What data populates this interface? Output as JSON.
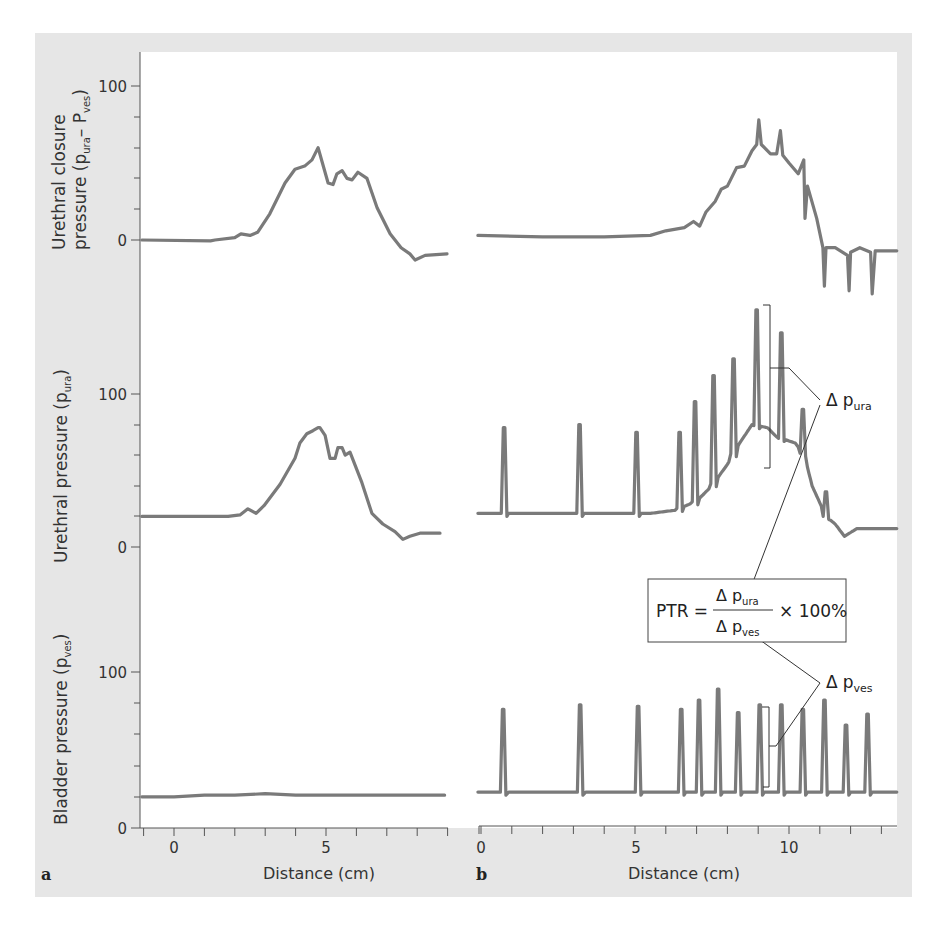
{
  "figure": {
    "background_color": "#e6e6e6",
    "plot_area_color": "#ffffff",
    "trace_color": "#7a7a7a",
    "panel_labels": [
      "a",
      "b"
    ]
  },
  "axes": {
    "x_label": "Distance (cm)",
    "panel_a_x_ticks": [
      "0",
      "5"
    ],
    "panel_b_x_ticks": [
      "0",
      "5",
      "10"
    ],
    "rows": [
      {
        "id": "closure",
        "y_label_line1": "Urethral closure",
        "y_label_line2": "pressure (p",
        "y_label_sub1": "ura",
        "y_label_mid": "– P",
        "y_label_sub2": "ves",
        "y_label_end": ")",
        "y_ticks": [
          "0",
          "100"
        ]
      },
      {
        "id": "urethral",
        "y_label": "Urethral pressure (p",
        "y_label_sub": "ura",
        "y_label_end": ")",
        "y_ticks": [
          "0",
          "100"
        ]
      },
      {
        "id": "bladder",
        "y_label": "Bladder pressure (p",
        "y_label_sub": "ves",
        "y_label_end": ")",
        "y_ticks": [
          "0",
          "100"
        ]
      }
    ]
  },
  "annotations": {
    "delta": "Δ",
    "p": "p",
    "ura_sub": "ura",
    "ves_sub": "ves",
    "ptr_formula": {
      "lhs": "PTR =",
      "numerator_sub": "ura",
      "denominator_sub": "ves",
      "multiplier": "× 100%"
    }
  },
  "chart_data": [
    {
      "type": "line",
      "title": "a – Urethral closure pressure (p_ura − p_ves)",
      "xlabel": "Distance (cm)",
      "ylabel": "Urethral closure pressure (p_ura − p_ves)",
      "xlim": [
        -1.1,
        9.0
      ],
      "ylim": [
        -15,
        120
      ],
      "x_ticks": [
        0,
        5
      ],
      "y_ticks": [
        0,
        100
      ],
      "x": [
        -1.06,
        1.2,
        1.35,
        2.0,
        2.2,
        2.5,
        2.75,
        3.15,
        3.65,
        3.98,
        4.3,
        4.54,
        4.74,
        4.87,
        5.07,
        5.23,
        5.36,
        5.53,
        5.69,
        5.86,
        6.05,
        6.35,
        6.68,
        7.11,
        7.47,
        7.76,
        7.93,
        8.26,
        8.98
      ],
      "y": [
        0,
        -0.5,
        0,
        1.5,
        4,
        3,
        5,
        17,
        37,
        46,
        48,
        52,
        60,
        51,
        37,
        36,
        43,
        45,
        40,
        39,
        44,
        40,
        21,
        4,
        -5,
        -9,
        -13,
        -10,
        -9
      ],
      "grid": false
    },
    {
      "type": "line",
      "title": "b – Urethral closure pressure (p_ura − p_ves)",
      "xlabel": "Distance (cm)",
      "ylabel": "Urethral closure pressure (p_ura − p_ves)",
      "xlim": [
        -0.1,
        13.6
      ],
      "ylim": [
        -45,
        120
      ],
      "x_ticks": [
        0,
        5,
        10
      ],
      "y_ticks": [
        0,
        100
      ],
      "x": [
        -0.1,
        2.0,
        4.0,
        5.5,
        6.0,
        6.6,
        6.9,
        7.1,
        7.3,
        7.6,
        7.8,
        8.0,
        8.3,
        8.55,
        8.8,
        8.95,
        9.02,
        9.1,
        9.4,
        9.6,
        9.72,
        9.8,
        10.0,
        10.3,
        10.48,
        10.52,
        10.6,
        10.9,
        11.1,
        11.15,
        11.2,
        11.5,
        11.9,
        11.95,
        12.0,
        12.3,
        12.65,
        12.7,
        12.8,
        13.5
      ],
      "y": [
        3,
        2,
        2,
        3,
        6,
        8,
        12,
        9,
        18,
        25,
        33,
        35,
        47,
        48,
        58,
        62,
        78,
        62,
        56,
        56,
        71,
        55,
        50,
        43,
        52,
        14,
        35,
        14,
        -5,
        -30,
        -5,
        -5,
        -10,
        -33,
        -8,
        -5,
        -8,
        -35,
        -7,
        -7
      ],
      "grid": false
    },
    {
      "type": "line",
      "title": "a – Urethral pressure (p_ura)",
      "xlabel": "Distance (cm)",
      "ylabel": "Urethral pressure (p_ura)",
      "xlim": [
        -1.1,
        9.0
      ],
      "ylim": [
        -10,
        120
      ],
      "x_ticks": [
        0,
        5
      ],
      "y_ticks": [
        0,
        100
      ],
      "x": [
        -1.06,
        1.78,
        2.17,
        2.43,
        2.7,
        2.96,
        3.49,
        3.98,
        4.14,
        4.37,
        4.57,
        4.74,
        4.8,
        4.97,
        5.13,
        5.3,
        5.39,
        5.53,
        5.63,
        5.79,
        6.18,
        6.51,
        6.87,
        7.27,
        7.53,
        7.76,
        8.09,
        8.75
      ],
      "y": [
        20,
        20,
        21,
        25,
        22,
        27,
        41,
        58,
        68,
        74,
        76,
        78,
        78,
        73,
        58,
        58,
        65,
        65,
        60,
        62,
        42,
        22,
        15,
        10,
        5,
        7,
        9,
        9
      ],
      "grid": false
    },
    {
      "type": "line",
      "title": "b – Urethral pressure (p_ura) with cough spikes",
      "xlabel": "Distance (cm)",
      "ylabel": "Urethral pressure (p_ura)",
      "xlim": [
        -0.1,
        13.6
      ],
      "ylim": [
        -10,
        150
      ],
      "x_ticks": [
        0,
        5,
        10
      ],
      "y_ticks": [
        0,
        100
      ],
      "spike_positions_cm": [
        0.75,
        3.2,
        5.05,
        6.45,
        6.95,
        7.55,
        8.2,
        8.95,
        9.75,
        10.45,
        11.2
      ],
      "spike_peaks": [
        78,
        80,
        75,
        75,
        95,
        112,
        123,
        155,
        140,
        90,
        36
      ],
      "baseline_x": [
        -0.1,
        5.5,
        6.3,
        7.0,
        7.5,
        8.0,
        8.4,
        8.8,
        9.3,
        9.6,
        10.2,
        10.5,
        10.75,
        11.2,
        11.5,
        11.8,
        12.2,
        13.5
      ],
      "baseline_y": [
        22,
        22,
        24,
        30,
        40,
        54,
        68,
        80,
        78,
        72,
        68,
        60,
        40,
        20,
        15,
        7,
        12,
        12
      ],
      "grid": false
    },
    {
      "type": "line",
      "title": "a – Bladder pressure (p_ves)",
      "xlabel": "Distance (cm)",
      "ylabel": "Bladder pressure (p_ves)",
      "xlim": [
        -1.1,
        9.0
      ],
      "ylim": [
        0,
        120
      ],
      "x_ticks": [
        0,
        5
      ],
      "y_ticks": [
        0,
        100
      ],
      "x": [
        -1.06,
        0,
        1,
        2,
        3,
        4,
        5,
        6,
        7,
        8,
        8.9
      ],
      "y": [
        20,
        20,
        21,
        21,
        22,
        21,
        21,
        21,
        21,
        21,
        21
      ],
      "grid": false
    },
    {
      "type": "line",
      "title": "b – Bladder pressure (p_ves) with cough spikes",
      "xlabel": "Distance (cm)",
      "ylabel": "Bladder pressure (p_ves)",
      "xlim": [
        -0.1,
        13.6
      ],
      "ylim": [
        0,
        120
      ],
      "x_ticks": [
        0,
        5,
        10
      ],
      "y_ticks": [
        0,
        100
      ],
      "baseline": 23,
      "spike_positions_cm": [
        0.72,
        3.22,
        5.1,
        6.5,
        7.08,
        7.7,
        8.35,
        9.05,
        9.75,
        10.45,
        11.15,
        11.85,
        12.55
      ],
      "spike_peaks": [
        76,
        79,
        78,
        76,
        82,
        89,
        74,
        79,
        79,
        76,
        82,
        66,
        73
      ],
      "grid": false
    }
  ]
}
